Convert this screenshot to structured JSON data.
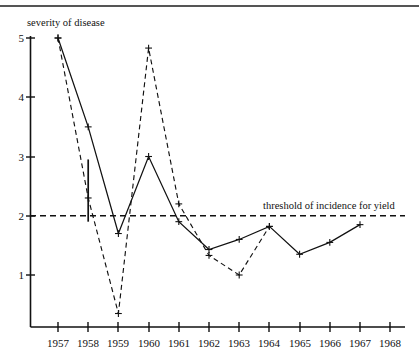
{
  "chart_data": {
    "type": "line",
    "title": "",
    "xlabel": "",
    "ylabel": "severity of disease",
    "x": [
      1957,
      1958,
      1959,
      1960,
      1961,
      1962,
      1963,
      1964,
      1965,
      1966,
      1967,
      1968
    ],
    "categories": [
      "1957",
      "1958",
      "1959",
      "1960",
      "1961",
      "1962",
      "1963",
      "1964",
      "1965",
      "1966",
      "1967",
      "1968"
    ],
    "xlim": [
      1957,
      1968
    ],
    "ylim": [
      0,
      5
    ],
    "yticks": [
      1,
      2,
      3,
      4,
      5
    ],
    "ytick_labels": [
      "1",
      "2",
      "3",
      "4",
      "5"
    ],
    "grid": false,
    "legend": "none",
    "series": [
      {
        "name": "solid",
        "style": "solid",
        "marker": "plus",
        "x": [
          1957,
          1958,
          1959,
          1960,
          1961,
          1962,
          1963,
          1964,
          1965,
          1966,
          1967
        ],
        "values": [
          5.0,
          3.5,
          1.7,
          3.0,
          1.9,
          1.43,
          1.6,
          1.82,
          1.35,
          1.55,
          1.85
        ]
      },
      {
        "name": "dashed",
        "style": "dashed",
        "marker": "plus",
        "x": [
          1957,
          1958,
          1959,
          1960,
          1961,
          1962,
          1963,
          1964
        ],
        "values": [
          5.0,
          2.3,
          0.35,
          4.83,
          2.2,
          1.33,
          1.0,
          1.82
        ]
      }
    ],
    "annotations": [
      {
        "name": "threshold",
        "label": "threshold of incidence for yield",
        "type": "hline",
        "value": 2.0,
        "style": "dashed"
      },
      {
        "name": "error-bar-1958",
        "type": "errorbar",
        "x": 1958,
        "low": 1.9,
        "high": 2.95
      }
    ]
  },
  "axis": {
    "y_title": "severity of disease",
    "y_labels": [
      "5",
      "4",
      "3",
      "2",
      "1"
    ],
    "x_labels": [
      "1957",
      "1958",
      "1959",
      "1960",
      "1961",
      "1962",
      "1963",
      "1964",
      "1965",
      "1966",
      "1967",
      "1968"
    ]
  },
  "threshold": {
    "label": "threshold of incidence for yield"
  }
}
